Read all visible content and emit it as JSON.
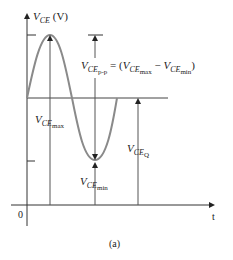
{
  "figure": {
    "caption": "(a)",
    "y_axis_label": {
      "var": "V",
      "sub": "CE",
      "unit": "(V)"
    },
    "x_axis_label": "t",
    "origin_label": "0",
    "labels": {
      "vce_pp": {
        "var": "V",
        "sub": "CE",
        "subsub": "p-p",
        "equals": "= (",
        "max_var": "V",
        "max_sub": "CE",
        "max_subsub": "max",
        "minus": " − ",
        "min_var": "V",
        "min_sub": "CE",
        "min_subsub": "min",
        "close": ")"
      },
      "vce_max": {
        "var": "V",
        "sub": "CE",
        "subsub": "max"
      },
      "vce_min": {
        "var": "V",
        "sub": "CE",
        "subsub": "min"
      },
      "vce_q": {
        "var": "V",
        "sub": "CE",
        "subsub": "Q"
      }
    },
    "colors": {
      "waveform": "#8a8a8a",
      "axes": "#333333",
      "arrows": "#555555"
    }
  }
}
